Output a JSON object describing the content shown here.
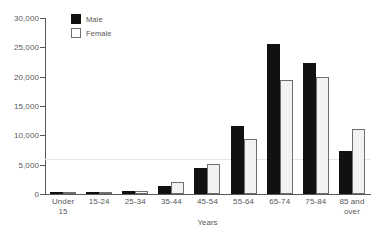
{
  "chart_data": {
    "type": "bar",
    "title": "",
    "xlabel": "Years",
    "ylabel": "",
    "ylim": [
      0,
      30000
    ],
    "ytick_values": [
      0,
      5000,
      10000,
      15000,
      20000,
      25000,
      30000
    ],
    "ytick_labels": [
      "0",
      "5,000",
      "10,000",
      "15,000",
      "20,000",
      "25,000",
      "30,000"
    ],
    "grid": true,
    "gridlines": [
      6000
    ],
    "legend_position": "top-left",
    "categories": [
      "Under\n15",
      "15-24",
      "25-34",
      "35-44",
      "45-54",
      "55-64",
      "65-74",
      "75-84",
      "85 and\nover"
    ],
    "category_labels": [
      [
        "Under",
        "15"
      ],
      [
        "15-24"
      ],
      [
        "25-34"
      ],
      [
        "35-44"
      ],
      [
        "45-54"
      ],
      [
        "55-64"
      ],
      [
        "65-74"
      ],
      [
        "75-84"
      ],
      [
        "85 and",
        "over"
      ]
    ],
    "series": [
      {
        "name": "Male",
        "color": "#111111",
        "values": [
          120,
          180,
          430,
          1300,
          4400,
          11600,
          25500,
          22300,
          7300
        ]
      },
      {
        "name": "Female",
        "color": "#f2f2f0",
        "values": [
          100,
          150,
          480,
          2000,
          5200,
          9400,
          19400,
          19900,
          11000
        ]
      }
    ]
  },
  "legend": {
    "items": [
      {
        "label": "Male"
      },
      {
        "label": "Female"
      }
    ]
  }
}
